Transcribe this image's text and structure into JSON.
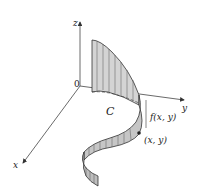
{
  "figure": {
    "axes": {
      "x_label": "x",
      "y_label": "y",
      "z_label": "z",
      "origin_label": "0"
    },
    "curve_label": "C",
    "height_label": "f(x, y)",
    "point_label": "(x, y)",
    "colors": {
      "surface_fill": "#c8c8c8",
      "surface_back": "#dcdcdc",
      "lines": "#333333",
      "axes": "#444444"
    }
  }
}
